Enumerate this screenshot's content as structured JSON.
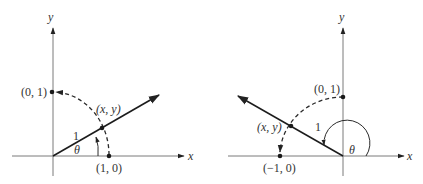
{
  "figures": [
    {
      "name": "first-quadrant",
      "axis_labels": {
        "x": "x",
        "y": "y"
      },
      "points": [
        {
          "label": "(0, 1)"
        },
        {
          "label": "(1, 0)"
        },
        {
          "label": "(x, y)"
        }
      ],
      "radius_label": "1",
      "angle_label": "θ"
    },
    {
      "name": "second-quadrant",
      "axis_labels": {
        "x": "x",
        "y": "y"
      },
      "points": [
        {
          "label": "(0, 1)"
        },
        {
          "label": "(−1, 0)"
        },
        {
          "label": "(x, y)"
        }
      ],
      "radius_label": "1",
      "angle_label": "θ"
    }
  ]
}
